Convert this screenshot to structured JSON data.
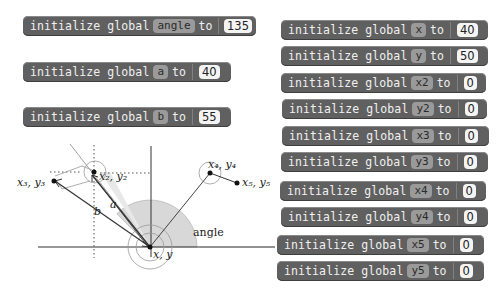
{
  "blocks_left": [
    {
      "keyword": "initialize global",
      "var": "angle",
      "to": "to",
      "value": "135"
    },
    {
      "keyword": "initialize global",
      "var": "a",
      "to": "to",
      "value": "40"
    },
    {
      "keyword": "initialize global",
      "var": "b",
      "to": "to",
      "value": "55"
    }
  ],
  "blocks_right": [
    {
      "keyword": "initialize global",
      "var": "x",
      "to": "to",
      "value": "40"
    },
    {
      "keyword": "initialize global",
      "var": "y",
      "to": "to",
      "value": "50"
    },
    {
      "keyword": "initialize global",
      "var": "x2",
      "to": "to",
      "value": "0"
    },
    {
      "keyword": "initialize global",
      "var": "y2",
      "to": "to",
      "value": "0"
    },
    {
      "keyword": "initialize global",
      "var": "x3",
      "to": "to",
      "value": "0"
    },
    {
      "keyword": "initialize global",
      "var": "y3",
      "to": "to",
      "value": "0"
    },
    {
      "keyword": "initialize global",
      "var": "x4",
      "to": "to",
      "value": "0"
    },
    {
      "keyword": "initialize global",
      "var": "y4",
      "to": "to",
      "value": "0"
    },
    {
      "keyword": "initialize global",
      "var": "x5",
      "to": "to",
      "value": "0"
    },
    {
      "keyword": "initialize global",
      "var": "y5",
      "to": "to",
      "value": "0"
    }
  ],
  "diagram": {
    "labels": {
      "p1": "x, y",
      "p2": "x₂, y₂",
      "p3": "x₃, y₃",
      "p4": "x₄, y₄",
      "p5": "x₅, y₅",
      "a": "a",
      "b": "b",
      "angle": "angle"
    }
  },
  "colors": {
    "block_bg": "#606060",
    "var_bg": "#9a9a9a",
    "value_bg": "#f4f4f4",
    "angle_fill": "#d8d8d8"
  }
}
